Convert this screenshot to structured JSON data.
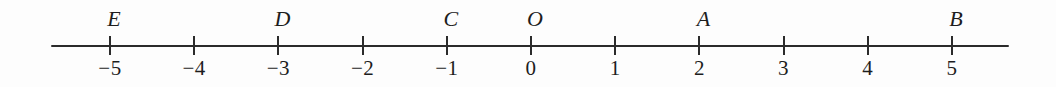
{
  "figure": {
    "kind": "number-line",
    "background_color": "#fdfdfd",
    "ink_color": "#2b2b2b"
  },
  "chart_data": {
    "type": "scatter",
    "title": "",
    "subtitle": "",
    "xlabel": "",
    "ylabel": "",
    "orientation": "horizontal",
    "grid": false,
    "legend": null,
    "axis": {
      "min_tick": -5,
      "max_tick": 5,
      "tick_step": 1,
      "line_start_value": -5.7,
      "line_end_value": 5.65,
      "tick_labels": [
        "−5",
        "−4",
        "−3",
        "−2",
        "−1",
        "0",
        "1",
        "2",
        "3",
        "4",
        "5"
      ],
      "tick_values": [
        -5,
        -4,
        -3,
        -2,
        -1,
        0,
        1,
        2,
        3,
        4,
        5
      ]
    },
    "points": [
      {
        "label": "E",
        "value": -5
      },
      {
        "label": "D",
        "value": -3
      },
      {
        "label": "C",
        "value": -1
      },
      {
        "label": "O",
        "value": 0
      },
      {
        "label": "A",
        "value": 2
      },
      {
        "label": "B",
        "value": 5
      }
    ],
    "x": [
      -5,
      -3,
      -1,
      0,
      2,
      5
    ],
    "annotations": [
      "E",
      "D",
      "C",
      "O",
      "A",
      "B"
    ]
  },
  "geometry": {
    "px_per_unit": 84.2,
    "origin_x_px": 531,
    "axis_y_px": 45,
    "line_left_px": 51,
    "line_right_px": 1009,
    "tick_top_px": 36,
    "tick_bottom_px": 55,
    "tick_label_top_px": 58,
    "point_label_top_px": 8,
    "point_label_offset_px": 4
  }
}
